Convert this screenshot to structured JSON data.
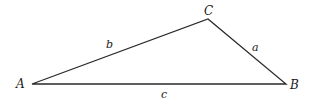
{
  "diagram": {
    "type": "triangle",
    "stroke_color": "#2a2a2a",
    "vertices": [
      {
        "label": "A",
        "x": 32,
        "y": 84
      },
      {
        "label": "B",
        "x": 286,
        "y": 84
      },
      {
        "label": "C",
        "x": 208,
        "y": 19
      }
    ],
    "sides": [
      {
        "label": "a",
        "between": "B-C"
      },
      {
        "label": "b",
        "between": "A-C"
      },
      {
        "label": "c",
        "between": "A-B"
      }
    ]
  }
}
